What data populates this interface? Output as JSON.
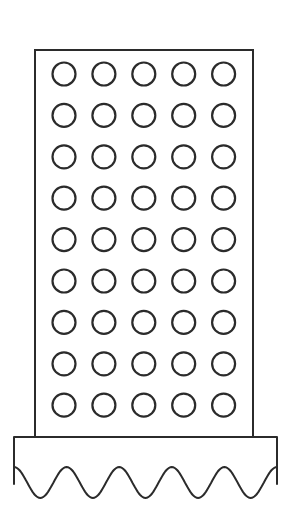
{
  "figure": {
    "stroke_color": "#2b2b2b",
    "background": "#ffffff",
    "grid": {
      "columns": 5,
      "rows": 9,
      "circle_radius": 11.5,
      "first_center": [
        64,
        74
      ],
      "column_spacing": 39.9,
      "row_spacing": 41.4
    },
    "panel": {
      "x": 35,
      "y": 50,
      "width": 218,
      "height": 387
    },
    "base": {
      "x": 14,
      "y": 437,
      "width": 263,
      "scallops": 5,
      "arches": 4
    }
  }
}
